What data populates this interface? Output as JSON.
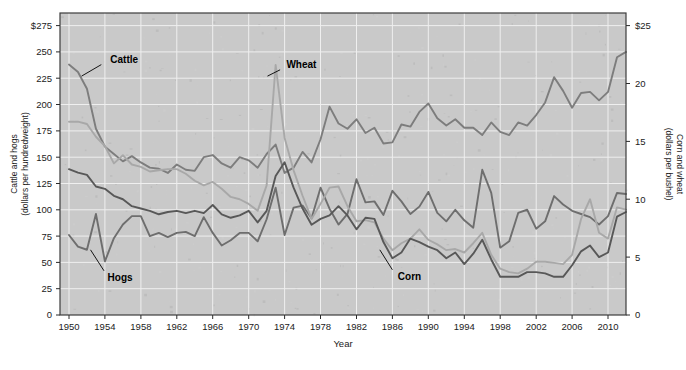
{
  "chart_data": {
    "type": "line",
    "title": "",
    "xlabel": "Year",
    "grid": true,
    "legend_position": "inline-annotations",
    "x": [
      1950,
      1951,
      1952,
      1953,
      1954,
      1955,
      1956,
      1957,
      1958,
      1959,
      1960,
      1961,
      1962,
      1963,
      1964,
      1965,
      1966,
      1967,
      1968,
      1969,
      1970,
      1971,
      1972,
      1973,
      1974,
      1975,
      1976,
      1977,
      1978,
      1979,
      1980,
      1981,
      1982,
      1983,
      1984,
      1985,
      1986,
      1987,
      1988,
      1989,
      1990,
      1991,
      1992,
      1993,
      1994,
      1995,
      1996,
      1997,
      1998,
      1999,
      2000,
      2001,
      2002,
      2003,
      2004,
      2005,
      2006,
      2007,
      2008,
      2009,
      2010,
      2011,
      2012
    ],
    "xlim": [
      1949,
      2012
    ],
    "xticks": [
      1950,
      1954,
      1958,
      1962,
      1966,
      1970,
      1974,
      1978,
      1982,
      1986,
      1990,
      1994,
      1998,
      2002,
      2006,
      2010
    ],
    "axes": {
      "left": {
        "label": "Cattle and hogs",
        "sublabel": "(dollars per hundredweight)",
        "ticks": [
          0,
          25,
          50,
          75,
          100,
          125,
          150,
          175,
          200,
          225,
          250,
          275
        ],
        "tick_labels": [
          "0",
          "25",
          "50",
          "75",
          "100",
          "125",
          "150",
          "175",
          "200",
          "225",
          "250",
          "$275"
        ],
        "lim": [
          0,
          287
        ]
      },
      "right": {
        "label": "Corn and wheat",
        "sublabel": "(dollars per bushel)",
        "ticks": [
          0,
          5,
          10,
          15,
          20,
          25
        ],
        "tick_labels": [
          "0",
          "5",
          "10",
          "15",
          "20",
          "$25"
        ],
        "lim": [
          0,
          26.09
        ]
      }
    },
    "series": [
      {
        "name": "Cattle",
        "axis": "left",
        "unit": "dollars per hundredweight",
        "color": "#7d7d7d",
        "label_x": 1954.6,
        "label_y": 243,
        "leader": [
          [
            1953.6,
            238
          ],
          [
            1951.4,
            227
          ]
        ],
        "values": [
          238,
          231,
          215,
          177,
          160,
          153,
          146,
          151,
          145,
          140,
          139,
          135,
          143,
          138,
          137,
          150,
          152,
          144,
          140,
          150,
          147,
          140,
          153,
          162,
          135,
          140,
          155,
          145,
          167,
          198,
          182,
          177,
          186,
          173,
          178,
          163,
          164,
          181,
          179,
          193,
          201,
          187,
          180,
          186,
          178,
          178,
          171,
          183,
          174,
          171,
          183,
          180,
          190,
          202,
          226,
          213,
          197,
          211,
          212,
          204,
          212,
          245,
          250
        ]
      },
      {
        "name": "Hogs",
        "axis": "left",
        "unit": "dollars per hundredweight",
        "color": "#6e6e6e",
        "label_x": 1954.3,
        "label_y": 36,
        "leader": [
          [
            1953.9,
            42
          ],
          [
            1952.4,
            62
          ]
        ],
        "values": [
          76,
          65,
          62,
          96,
          51,
          73,
          86,
          94,
          94,
          75,
          78,
          74,
          78,
          79,
          75,
          93,
          78,
          66,
          71,
          78,
          78,
          70,
          91,
          121,
          76,
          102,
          104,
          92,
          121,
          101,
          86,
          96,
          129,
          107,
          108,
          95,
          118,
          108,
          96,
          103,
          117,
          97,
          89,
          100,
          90,
          83,
          138,
          116,
          64,
          70,
          97,
          100,
          82,
          89,
          113,
          105,
          99,
          96,
          93,
          86,
          94,
          116,
          115
        ]
      },
      {
        "name": "Wheat",
        "axis": "right",
        "unit": "dollars per bushel",
        "color": "#a8a8a8",
        "label_x": 1974.2,
        "label_y": 238,
        "leader": [
          [
            1973.5,
            233
          ],
          [
            1972.1,
            227
          ]
        ],
        "values": [
          16.7,
          16.7,
          16.5,
          15.4,
          14.6,
          13.1,
          13.8,
          13.0,
          12.8,
          12.4,
          12.5,
          12.6,
          12.6,
          12.2,
          11.6,
          11.2,
          11.5,
          10.9,
          10.2,
          10.0,
          9.6,
          9.0,
          11.2,
          21.6,
          15.3,
          12.5,
          10.3,
          8.3,
          9.6,
          11.0,
          11.1,
          9.4,
          8.1,
          8.2,
          8.0,
          6.6,
          5.6,
          6.2,
          6.6,
          7.4,
          6.5,
          6.1,
          5.6,
          5.7,
          5.4,
          6.2,
          7.1,
          5.2,
          4.0,
          3.7,
          3.6,
          4.0,
          4.6,
          4.6,
          4.5,
          4.4,
          5.2,
          8.3,
          10.0,
          7.1,
          6.6,
          9.3,
          9.1
        ]
      },
      {
        "name": "Corn",
        "axis": "right",
        "unit": "dollars per bushel",
        "color": "#585858",
        "label_x": 1986.6,
        "label_y": 37,
        "leader": [
          [
            1986.0,
            43
          ],
          [
            1984.6,
            62
          ]
        ],
        "values": [
          12.6,
          12.3,
          12.1,
          11.1,
          10.9,
          10.3,
          10.0,
          9.4,
          9.2,
          9.0,
          8.7,
          8.9,
          9.0,
          8.8,
          9.0,
          8.8,
          9.5,
          8.7,
          8.4,
          8.6,
          9.0,
          8.0,
          9.0,
          12.0,
          13.2,
          11.0,
          9.2,
          7.8,
          8.3,
          8.6,
          9.4,
          8.6,
          7.4,
          8.4,
          8.3,
          6.3,
          4.9,
          5.4,
          6.6,
          6.3,
          5.9,
          5.6,
          4.9,
          5.4,
          4.4,
          5.3,
          6.5,
          4.8,
          3.3,
          3.3,
          3.3,
          3.7,
          3.7,
          3.6,
          3.3,
          3.3,
          4.3,
          5.5,
          6.0,
          5.0,
          5.4,
          8.5,
          8.9
        ]
      }
    ]
  }
}
